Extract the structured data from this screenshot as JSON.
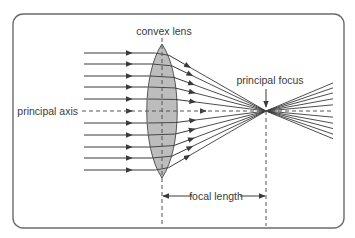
{
  "diagram": {
    "labels": {
      "lens": "convex lens",
      "axis": "principal axis",
      "focus": "principal focus",
      "focal_length": "focal length"
    },
    "colors": {
      "border": "#6b6b6b",
      "ray": "#3a3a3a",
      "lens_fill": "#bdbdbd",
      "lens_stroke": "#555555",
      "dash": "#555555",
      "text": "#3a3a3a"
    },
    "geometry": {
      "frame": {
        "x": 13,
        "y": 14,
        "w": 331,
        "h": 214,
        "r": 10
      },
      "lens": {
        "x": 162,
        "top": 44,
        "bottom": 178,
        "half_width": 14
      },
      "axis_y": 111,
      "focus_x": 266,
      "ray_start_x": 84,
      "ray_arrow_x": 132,
      "ray_ys": [
        53,
        64,
        76,
        87,
        99,
        111,
        123,
        135,
        147,
        158,
        170
      ],
      "diverge_end_x": 333,
      "diverge_spread": 0.72,
      "focal_line_y": 196
    }
  }
}
